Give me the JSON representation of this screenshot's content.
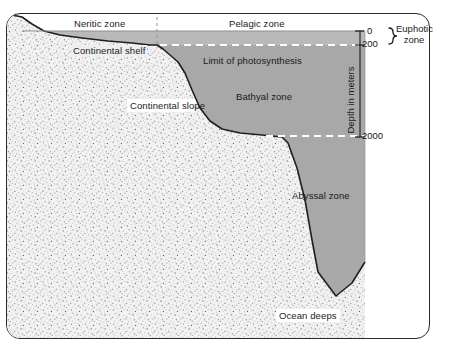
{
  "figure": {
    "zone_labels": {
      "neritic": "Neritic zone",
      "pelagic": "Pelagic zone",
      "continental_shelf": "Continental shelf",
      "continental_slope": "Continental slope",
      "limit_of_photosynthesis": "Limit of photosynthesis",
      "bathyal": "Bathyal zone",
      "abyssal": "Abyssal zone",
      "ocean_deeps": "Ocean deeps",
      "euphotic": "Euphotic zone"
    },
    "depth_scale": {
      "axis_label": "Depth in meters",
      "ticks": [
        "0",
        "200",
        "2000"
      ],
      "tick_0": "0",
      "tick_200": "200",
      "tick_2000": "2000"
    },
    "colors": {
      "surface_water": "#b9b9b9",
      "deep_water": "#a8a8a8",
      "seabed": "#efefef",
      "outline": "#1a1a1a",
      "dashed_line": "#ffffff",
      "divider": "#9a9a9a"
    }
  }
}
